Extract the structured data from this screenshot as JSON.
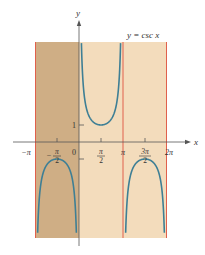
{
  "chart_data": {
    "type": "line",
    "title": "y = csc x",
    "xlabel": "x",
    "ylabel": "y",
    "function": "csc(x)",
    "xlim": [
      -3.1416,
      6.2832
    ],
    "ylim": [
      -5.8,
      5.8
    ],
    "x_ticks": [
      {
        "value": -3.1416,
        "label": "−π"
      },
      {
        "value": -1.5708,
        "label": "−π/2"
      },
      {
        "value": 0,
        "label": "0"
      },
      {
        "value": 1.5708,
        "label": "π/2"
      },
      {
        "value": 3.1416,
        "label": "π"
      },
      {
        "value": 4.7124,
        "label": "3π/2"
      },
      {
        "value": 6.2832,
        "label": "2π"
      }
    ],
    "y_ticks": [
      {
        "value": 1,
        "label": "1"
      }
    ],
    "vertical_asymptotes": [
      -3.1416,
      3.1416,
      6.2832
    ],
    "branches": [
      {
        "interval": [
          -3.1416,
          0
        ],
        "extremum": {
          "x": -1.5708,
          "y": -1
        },
        "opens": "down"
      },
      {
        "interval": [
          0,
          3.1416
        ],
        "extremum": {
          "x": 1.5708,
          "y": 1
        },
        "opens": "up"
      },
      {
        "interval": [
          3.1416,
          6.2832
        ],
        "extremum": {
          "x": 4.7124,
          "y": -1
        },
        "opens": "down"
      }
    ],
    "shaded_regions": [
      {
        "x_from": -3.1416,
        "x_to": 0,
        "shade": "dark"
      },
      {
        "x_from": 0,
        "x_to": 6.2832,
        "shade": "light"
      }
    ],
    "grid": false,
    "legend": null
  },
  "labels": {
    "title": "y = csc x",
    "x_axis": "x",
    "y_axis": "y",
    "y_tick_1": "1",
    "tick_neg_pi": "−π",
    "tick_neg_half_pi_num": "π",
    "tick_neg_half_pi_den": "2",
    "tick_zero": "0",
    "tick_half_pi_num": "π",
    "tick_half_pi_den": "2",
    "tick_pi": "π",
    "tick_three_half_pi_num": "3π",
    "tick_three_half_pi_den": "2",
    "tick_two_pi": "2π"
  },
  "colors": {
    "background": "#ffffff",
    "shade_dark": "#cfae85",
    "shade_light": "#f3dcbc",
    "asymptote": "#e0604c",
    "curve": "#3e7f95",
    "axis": "#555555"
  }
}
